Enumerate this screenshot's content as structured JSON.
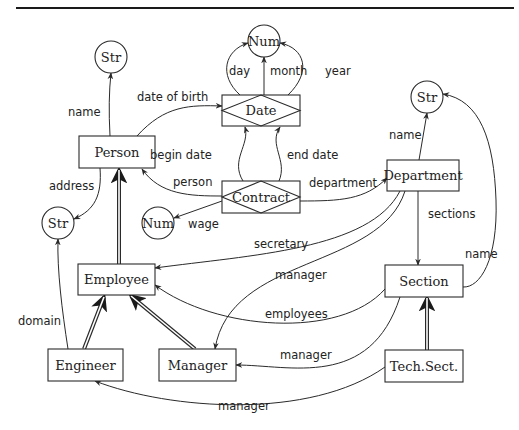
{
  "figure": {
    "width": 519,
    "height": 430,
    "top_rule": {
      "x1": 16,
      "x2": 514,
      "y": 8
    }
  },
  "nodes": [
    {
      "id": "str_person_name",
      "type": "value",
      "label": "Str",
      "cx": 111,
      "cy": 57,
      "r": 16
    },
    {
      "id": "num_date",
      "type": "value",
      "label": "Num",
      "cx": 264,
      "cy": 41,
      "r": 16
    },
    {
      "id": "date",
      "type": "relationship",
      "label": "Date",
      "x": 222,
      "y": 95,
      "w": 78,
      "h": 31
    },
    {
      "id": "person",
      "type": "entity",
      "label": "Person",
      "x": 79,
      "y": 136,
      "w": 76,
      "h": 32
    },
    {
      "id": "contract",
      "type": "relationship",
      "label": "Contract",
      "x": 222,
      "y": 181,
      "w": 78,
      "h": 32
    },
    {
      "id": "department",
      "type": "entity",
      "label": "Department",
      "x": 387,
      "y": 160,
      "w": 72,
      "h": 31
    },
    {
      "id": "str_dept_name",
      "type": "value",
      "label": "Str",
      "cx": 427,
      "cy": 97,
      "r": 16
    },
    {
      "id": "str_address",
      "type": "value",
      "label": "Str",
      "cx": 58,
      "cy": 223,
      "r": 16
    },
    {
      "id": "num_wage",
      "type": "value",
      "label": "Num",
      "cx": 158,
      "cy": 223,
      "r": 16
    },
    {
      "id": "employee",
      "type": "entity",
      "label": "Employee",
      "x": 78,
      "y": 264,
      "w": 77,
      "h": 31
    },
    {
      "id": "section",
      "type": "entity",
      "label": "Section",
      "x": 385,
      "y": 265,
      "w": 78,
      "h": 32
    },
    {
      "id": "engineer",
      "type": "entity",
      "label": "Engineer",
      "x": 48,
      "y": 349,
      "w": 75,
      "h": 32
    },
    {
      "id": "manager",
      "type": "entity",
      "label": "Manager",
      "x": 159,
      "y": 349,
      "w": 77,
      "h": 32
    },
    {
      "id": "tech_sect",
      "type": "entity",
      "label": "Tech.Sect.",
      "x": 385,
      "y": 350,
      "w": 78,
      "h": 32
    }
  ],
  "edges": [
    {
      "id": "person-name",
      "label": "name",
      "from": "person",
      "to": "str_person_name",
      "path": "M110 136 Q108 100 111 73",
      "lx": 68,
      "ly": 116
    },
    {
      "id": "person-dob",
      "label": "date of birth",
      "from": "person",
      "to": "date",
      "path": "M137 136 C165 105 190 105 222 106",
      "lx": 137,
      "ly": 101
    },
    {
      "id": "person-address",
      "label": "address",
      "from": "person",
      "to": "str_address",
      "path": "M100 168 C102 195 95 210 74 219",
      "lx": 49,
      "ly": 190
    },
    {
      "id": "date-day",
      "label": "day",
      "from": "date",
      "to": "num_date",
      "path": "M240 95 C218 75 225 50 248 43",
      "lx": 229,
      "ly": 75
    },
    {
      "id": "date-month",
      "label": "month",
      "from": "date",
      "to": "num_date",
      "path": "M264 95 L264 57",
      "lx": 270,
      "ly": 75
    },
    {
      "id": "date-year",
      "label": "year",
      "from": "date",
      "to": "num_date",
      "path": "M288 95 C312 72 305 48 280 43",
      "lx": 325,
      "ly": 75
    },
    {
      "id": "contract-begin",
      "label": "begin date",
      "from": "contract",
      "to": "date",
      "path": "M243 181 C230 160 250 145 245 127",
      "lx": 150,
      "ly": 159
    },
    {
      "id": "contract-end",
      "label": "end date",
      "from": "contract",
      "to": "date",
      "path": "M279 181 C288 160 268 145 280 127",
      "lx": 287,
      "ly": 159
    },
    {
      "id": "contract-person",
      "label": "person",
      "from": "contract",
      "to": "person",
      "path": "M222 196 C190 196 160 195 142 169",
      "lx": 173,
      "ly": 186
    },
    {
      "id": "contract-department",
      "label": "department",
      "from": "contract",
      "to": "department",
      "path": "M300 201 C340 201 365 200 387 178",
      "lx": 309,
      "ly": 187
    },
    {
      "id": "contract-wage",
      "label": "wage",
      "from": "contract",
      "to": "num_wage",
      "path": "M222 201 L174 218",
      "lx": 188,
      "ly": 228
    },
    {
      "id": "dept-name",
      "label": "name",
      "from": "department",
      "to": "str_dept_name",
      "path": "M419 160 L427 113",
      "lx": 389,
      "ly": 139
    },
    {
      "id": "dept-sections",
      "label": "sections",
      "from": "department",
      "to": "section",
      "path": "M418 191 L418 265",
      "lx": 428,
      "ly": 218
    },
    {
      "id": "dept-secretary",
      "label": "secretary",
      "from": "department",
      "to": "employee",
      "path": "M400 191 C370 250 250 255 155 268",
      "lx": 254,
      "ly": 248
    },
    {
      "id": "dept-manager",
      "label": "manager",
      "from": "department",
      "to": "manager",
      "path": "M405 191 C380 270 230 255 215 349",
      "lx": 275,
      "ly": 279
    },
    {
      "id": "section-name",
      "label": "name",
      "from": "section",
      "to": "str_dept_name",
      "path": "M463 287 C480 288 498 260 496 200 C494 140 480 100 443 94",
      "lx": 465,
      "ly": 258
    },
    {
      "id": "section-employees",
      "label": "employees",
      "from": "section",
      "to": "employee",
      "path": "M385 289 C340 340 215 330 155 285",
      "lx": 265,
      "ly": 318
    },
    {
      "id": "section-manager",
      "label": "manager",
      "from": "section",
      "to": "manager",
      "path": "M400 297 C370 390 290 365 236 365",
      "lx": 280,
      "ly": 359
    },
    {
      "id": "techsect-manager",
      "label": "manager",
      "from": "tech_sect",
      "to": "engineer",
      "path": "M385 367 C310 420 170 410 95 381",
      "lx": 218,
      "ly": 410
    },
    {
      "id": "engineer-domain",
      "label": "domain",
      "from": "engineer",
      "to": "str_address",
      "path": "M68 349 C62 310 57 270 58 239",
      "lx": 18,
      "ly": 325
    }
  ],
  "isa_edges": [
    {
      "id": "employee-isa-person",
      "from": "employee",
      "to": "person",
      "path": "M119 264 L119 170"
    },
    {
      "id": "engineer-isa-employee",
      "from": "engineer",
      "to": "employee",
      "path": "M84 349 L104 297"
    },
    {
      "id": "manager-isa-employee",
      "from": "manager",
      "to": "employee",
      "path": "M195 349 L131 296"
    },
    {
      "id": "techsect-isa-section",
      "from": "tech_sect",
      "to": "section",
      "path": "M427 350 L427 298"
    }
  ]
}
